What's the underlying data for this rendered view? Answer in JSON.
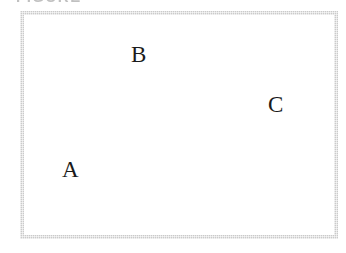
{
  "figure": {
    "width": 346,
    "height": 253,
    "background_color": "#ffffff",
    "clipped_header": {
      "note": "illegible-clipped-text-at-top-edge",
      "approx_text": "FIGURE",
      "color": "#8e8e8e"
    },
    "region": {
      "name": "bounding-rectangle",
      "border_color": "#cacaca",
      "fill_color": "#ffffff",
      "border_width_px": 4,
      "x": 20,
      "y": 11,
      "width": 318,
      "height": 228
    },
    "labels": [
      {
        "id": "label-a",
        "text": "A",
        "x": 62,
        "y": 158,
        "color": "#1b1b1b"
      },
      {
        "id": "label-b",
        "text": "B",
        "x": 131,
        "y": 43,
        "color": "#1b1b1b"
      },
      {
        "id": "label-c",
        "text": "C",
        "x": 268,
        "y": 93,
        "color": "#1b1b1b"
      }
    ]
  }
}
